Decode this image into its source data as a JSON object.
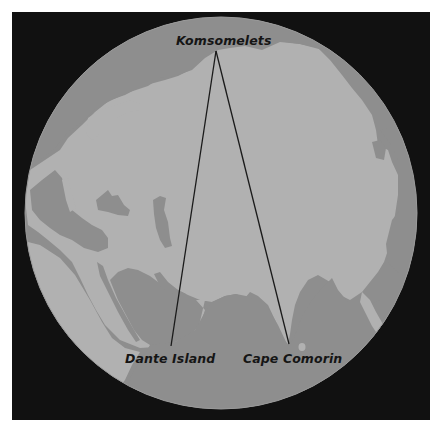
{
  "map": {
    "colors": {
      "page_background": "#ffffff",
      "frame_background": "#111111",
      "water": "#8e8e8e",
      "land": "#b1b1b1",
      "line": "#1a1a1a",
      "label_text": "#151515"
    },
    "globe": {
      "cx": 221,
      "cy": 213,
      "r": 196
    },
    "labels": [
      {
        "id": "komsomelets",
        "text": "Komsomelets",
        "x": 176,
        "y": 33
      },
      {
        "id": "dante-island",
        "text": "Dante Island",
        "x": 125,
        "y": 351
      },
      {
        "id": "cape-comorin",
        "text": "Cape Comorin",
        "x": 243,
        "y": 351
      }
    ],
    "points": {
      "komsomelets": [
        216,
        51
      ],
      "dante_island": [
        171,
        346
      ],
      "cape_comorin": [
        289,
        344
      ]
    },
    "lines": [
      {
        "from": "komsomelets",
        "to": "dante_island"
      },
      {
        "from": "komsomelets",
        "to": "cape_comorin"
      }
    ]
  }
}
